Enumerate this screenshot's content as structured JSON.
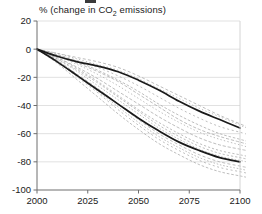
{
  "chart_data": {
    "type": "line",
    "title": "% (change in CO2 emissions)",
    "title_prefix": "% (change in CO",
    "title_sub": "2",
    "title_suffix": " emissions)",
    "xlabel": "",
    "ylabel": "",
    "xlim": [
      2000,
      2100
    ],
    "ylim": [
      -100,
      20
    ],
    "xticks": [
      2000,
      2025,
      2050,
      2075,
      2100
    ],
    "yticks": [
      20,
      0,
      -20,
      -40,
      -60,
      -80,
      -100
    ],
    "xtick_labels": [
      "2000",
      "2025",
      "2050",
      "2075",
      "2100"
    ],
    "ytick_labels": [
      "20",
      "0",
      "-20",
      "-40",
      "-60",
      "-80",
      "-100"
    ],
    "grid": "horizontal",
    "legend": "none",
    "x": [
      2000,
      2010,
      2020,
      2030,
      2040,
      2050,
      2060,
      2070,
      2080,
      2090,
      2100
    ],
    "series": [
      {
        "name": "upper-envelope",
        "style": "solid-black-bold",
        "color": "#1a1a1a",
        "values": [
          0,
          -5,
          -9,
          -12,
          -16,
          -22,
          -29,
          -37,
          -44,
          -50,
          -56
        ]
      },
      {
        "name": "lower-envelope",
        "style": "solid-black-bold",
        "color": "#1a1a1a",
        "values": [
          0,
          -9,
          -19,
          -29,
          -39,
          -49,
          -58,
          -66,
          -72,
          -77,
          -80
        ]
      },
      {
        "name": "scenario-1",
        "style": "dashed-gray",
        "color": "#a8a8a8",
        "values": [
          0,
          -3,
          -6,
          -9,
          -13,
          -19,
          -26,
          -33,
          -40,
          -47,
          -53
        ]
      },
      {
        "name": "scenario-2",
        "style": "dashed-gray",
        "color": "#a8a8a8",
        "values": [
          0,
          -4,
          -8,
          -13,
          -19,
          -26,
          -34,
          -42,
          -49,
          -55,
          -59
        ]
      },
      {
        "name": "scenario-3",
        "style": "dashed-gray",
        "color": "#a8a8a8",
        "values": [
          0,
          -4,
          -9,
          -15,
          -22,
          -30,
          -39,
          -47,
          -54,
          -60,
          -64
        ]
      },
      {
        "name": "scenario-4",
        "style": "dashed-gray",
        "color": "#a8a8a8",
        "values": [
          0,
          -5,
          -11,
          -18,
          -26,
          -35,
          -44,
          -52,
          -59,
          -64,
          -68
        ]
      },
      {
        "name": "scenario-5",
        "style": "dashed-gray",
        "color": "#a8a8a8",
        "values": [
          0,
          -6,
          -13,
          -21,
          -30,
          -39,
          -48,
          -56,
          -63,
          -68,
          -71
        ]
      },
      {
        "name": "scenario-6",
        "style": "dashed-gray",
        "color": "#a8a8a8",
        "values": [
          0,
          -6,
          -14,
          -23,
          -33,
          -43,
          -52,
          -60,
          -67,
          -72,
          -75
        ]
      },
      {
        "name": "scenario-7",
        "style": "dashed-gray",
        "color": "#a8a8a8",
        "values": [
          0,
          -7,
          -16,
          -26,
          -36,
          -46,
          -56,
          -64,
          -71,
          -76,
          -79
        ]
      },
      {
        "name": "scenario-8",
        "style": "dashed-gray",
        "color": "#a8a8a8",
        "values": [
          0,
          -8,
          -18,
          -28,
          -39,
          -50,
          -60,
          -68,
          -75,
          -80,
          -83
        ]
      },
      {
        "name": "scenario-9",
        "style": "dashed-gray",
        "color": "#a8a8a8",
        "values": [
          0,
          -9,
          -20,
          -31,
          -43,
          -54,
          -64,
          -72,
          -79,
          -84,
          -87
        ]
      },
      {
        "name": "scenario-10",
        "style": "dashed-gray",
        "color": "#a8a8a8",
        "values": [
          0,
          -10,
          -22,
          -34,
          -46,
          -57,
          -67,
          -75,
          -82,
          -87,
          -90
        ]
      },
      {
        "name": "scenario-11",
        "style": "dashed-gray",
        "color": "#a8a8a8",
        "values": [
          0,
          -3,
          -7,
          -11,
          -15,
          -21,
          -28,
          -35,
          -42,
          -48,
          -54
        ]
      },
      {
        "name": "scenario-12",
        "style": "dashed-gray",
        "color": "#a8a8a8",
        "values": [
          0,
          -5,
          -10,
          -16,
          -23,
          -32,
          -41,
          -50,
          -57,
          -62,
          -66
        ]
      },
      {
        "name": "scenario-13",
        "style": "dashed-gray",
        "color": "#a8a8a8",
        "values": [
          0,
          -7,
          -15,
          -24,
          -34,
          -44,
          -54,
          -62,
          -69,
          -74,
          -77
        ]
      },
      {
        "name": "scenario-14",
        "style": "dashed-gray",
        "color": "#a8a8a8",
        "values": [
          0,
          -8,
          -19,
          -30,
          -41,
          -52,
          -62,
          -70,
          -77,
          -82,
          -85
        ]
      }
    ]
  },
  "axes": {
    "plot_left": 37,
    "plot_right": 240,
    "plot_top": 21,
    "plot_bottom": 190
  }
}
